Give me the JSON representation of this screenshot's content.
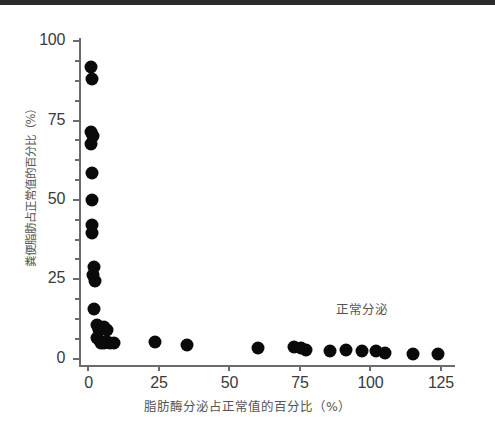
{
  "figure": {
    "background_color": "#ffffff",
    "point_color": "#0a0a0a",
    "axis_color": "#6b6b6b",
    "text_color": "#555555",
    "tick_text_color": "#3a3a3a"
  },
  "annotation": {
    "text": "正常分泌",
    "x_value": 97,
    "y_value": 16
  },
  "chart_data": {
    "type": "scatter",
    "title": "",
    "xlabel": "脂肪酶分泌占正常值的百分比（%）",
    "ylabel": "粪便脂肪占正常值的百分比（%）",
    "xlim": [
      -3,
      130
    ],
    "ylim": [
      -2,
      101
    ],
    "xticks": [
      0,
      25,
      50,
      75,
      100,
      125
    ],
    "xticklabels": [
      "0",
      "25",
      "50",
      "75",
      "100",
      "125"
    ],
    "yticks": [
      0,
      25,
      50,
      75,
      100
    ],
    "yticklabels": [
      "0",
      "25",
      "50",
      "75",
      "100"
    ],
    "x_minor_tick_count": 0,
    "y_minor_ticks": [
      6.25,
      12.5,
      18.75,
      31.25,
      37.5,
      43.75,
      56.25,
      62.5,
      68.75,
      81.25,
      87.5,
      93.75
    ],
    "grid": false,
    "legend": null,
    "marker_size_px": 13,
    "series": [
      {
        "name": "patients",
        "points": [
          [
            1.0,
            92.0
          ],
          [
            1.2,
            88.0
          ],
          [
            1.0,
            71.5
          ],
          [
            1.6,
            70.0
          ],
          [
            1.0,
            67.5
          ],
          [
            1.4,
            58.5
          ],
          [
            1.2,
            50.0
          ],
          [
            1.3,
            42.0
          ],
          [
            1.2,
            39.5
          ],
          [
            2.0,
            29.0
          ],
          [
            1.6,
            26.5
          ],
          [
            2.2,
            24.5
          ],
          [
            2.0,
            15.5
          ],
          [
            3.0,
            10.5
          ],
          [
            3.6,
            9.0
          ],
          [
            5.4,
            10.0
          ],
          [
            6.4,
            9.0
          ],
          [
            3.2,
            6.5
          ],
          [
            4.0,
            5.5
          ],
          [
            4.6,
            5.0
          ],
          [
            5.4,
            5.0
          ],
          [
            6.6,
            5.2
          ],
          [
            7.6,
            4.8
          ],
          [
            9.2,
            4.8
          ],
          [
            23.5,
            5.2
          ],
          [
            35.0,
            4.2
          ],
          [
            60.0,
            3.3
          ],
          [
            73.0,
            3.6
          ],
          [
            75.5,
            3.4
          ],
          [
            77.0,
            2.8
          ],
          [
            85.5,
            2.4
          ],
          [
            91.5,
            2.6
          ],
          [
            97.0,
            2.3
          ],
          [
            102.0,
            2.4
          ],
          [
            105.0,
            1.9
          ],
          [
            115.0,
            1.6
          ],
          [
            124.0,
            1.6
          ]
        ]
      }
    ]
  }
}
